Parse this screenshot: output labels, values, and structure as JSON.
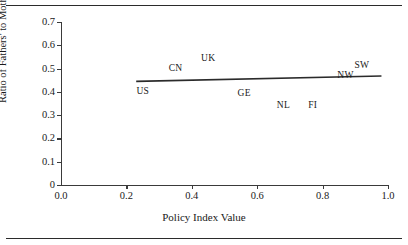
{
  "chart_data": {
    "type": "scatter",
    "title": "",
    "xlabel": "Policy Index Value",
    "ylabel": "Ratio of Fathers' to Mothers' Hours",
    "xlim": [
      0.0,
      1.0
    ],
    "ylim": [
      0.0,
      0.7
    ],
    "grid": false,
    "legend": null,
    "xticks": [
      "0.0",
      "0.2",
      "0.4",
      "0.6",
      "0.8",
      "1.0"
    ],
    "xtick_values": [
      0.0,
      0.2,
      0.4,
      0.6,
      0.8,
      1.0
    ],
    "yticks": [
      "0",
      "0.1",
      "0.2",
      "0.3",
      "0.4",
      "0.5",
      "0.6",
      "0.7"
    ],
    "ytick_values": [
      0.0,
      0.1,
      0.2,
      0.3,
      0.4,
      0.5,
      0.6,
      0.7
    ],
    "points": [
      {
        "label": "US",
        "x": 0.25,
        "y": 0.4
      },
      {
        "label": "CN",
        "x": 0.35,
        "y": 0.5
      },
      {
        "label": "UK",
        "x": 0.45,
        "y": 0.54
      },
      {
        "label": "GE",
        "x": 0.56,
        "y": 0.39
      },
      {
        "label": "NL",
        "x": 0.68,
        "y": 0.34
      },
      {
        "label": "FI",
        "x": 0.77,
        "y": 0.34
      },
      {
        "label": "NW",
        "x": 0.87,
        "y": 0.47
      },
      {
        "label": "SW",
        "x": 0.92,
        "y": 0.51
      }
    ],
    "trendline": {
      "x": [
        0.23,
        0.98
      ],
      "y": [
        0.445,
        0.468
      ]
    },
    "line_color": "#2b2b2b",
    "text_color": "#1a1a1a"
  },
  "figure": {
    "top_rule": "",
    "bottom_rule": ""
  }
}
